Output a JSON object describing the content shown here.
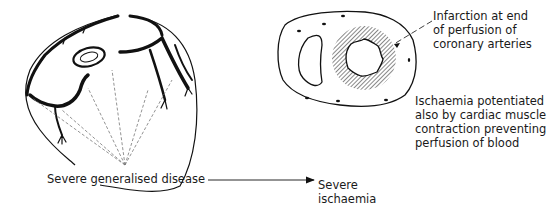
{
  "figure": {
    "heart_diagram": {
      "label": "Severe generalised disease",
      "arrow_target": "Severe ischaemia"
    },
    "cross_section": {
      "infarction_label": [
        "Infarction at end",
        "of perfusion of",
        "coronary arteries"
      ],
      "ischaemia_note": [
        "Ischaemia potentiated",
        "also by cardiac muscle",
        "contraction preventing",
        "perfusion of blood"
      ]
    },
    "outcome": [
      "Severe",
      "ischaemia"
    ],
    "colors": {
      "line": "#111111",
      "dashed": "#777777",
      "hatch": "#555555",
      "background": "#ffffff"
    }
  }
}
